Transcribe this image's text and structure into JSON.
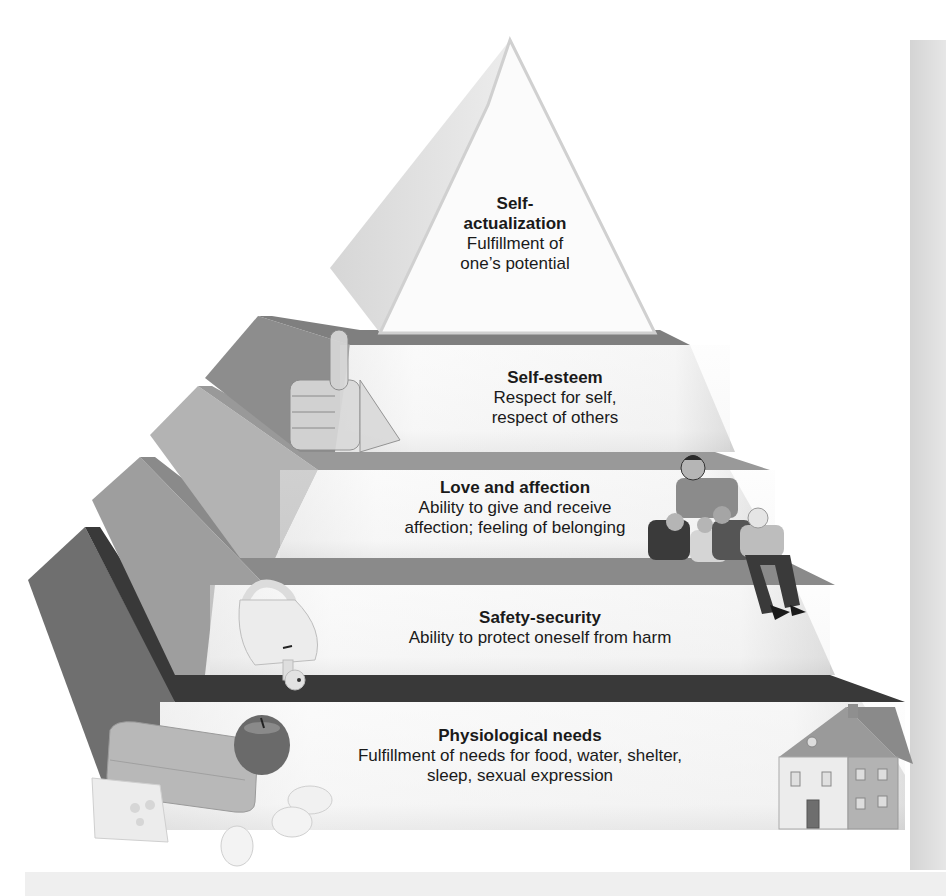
{
  "diagram": {
    "type": "hierarchy-pyramid",
    "levels": [
      {
        "rank": 5,
        "title": "Self-actualization",
        "title_line1": "Self-",
        "title_line2": "actualization",
        "desc_line1": "Fulfillment of",
        "desc_line2": "one’s potential",
        "illustration": "none"
      },
      {
        "rank": 4,
        "title": "Self-esteem",
        "desc_line1": "Respect for self,",
        "desc_line2": "respect of others",
        "illustration": "thumbs-up-hand"
      },
      {
        "rank": 3,
        "title": "Love and affection",
        "desc_line1": "Ability to give and receive",
        "desc_line2": "affection; feeling of belonging",
        "illustration": "family-group"
      },
      {
        "rank": 2,
        "title": "Safety-security",
        "desc_line1": "Ability to protect oneself from harm",
        "illustration": "padlock-with-key"
      },
      {
        "rank": 1,
        "title": "Physiological needs",
        "desc_line1": "Fulfillment of needs for food, water, shelter,",
        "desc_line2": "sleep, sexual expression",
        "illustration": "bread-cheese-apple-eggs-house"
      }
    ],
    "colors": {
      "face_light": "#f4f4f4",
      "side_mid": "#a9a9a9",
      "side_dark": "#6e6e6e",
      "strip_dark": "#3a3a3a",
      "text": "#1a1a1a"
    }
  }
}
